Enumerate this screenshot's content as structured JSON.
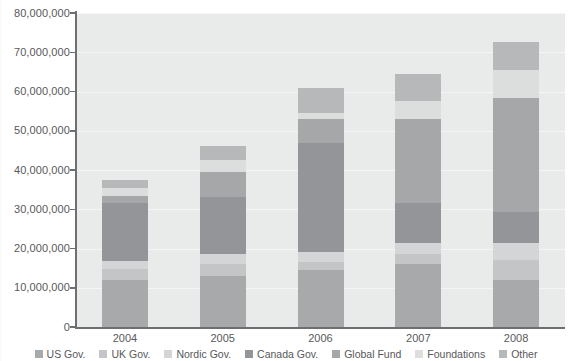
{
  "chart_data": {
    "type": "bar",
    "subtype": "stacked-bar",
    "title": "",
    "xlabel": "",
    "ylabel": "",
    "categories": [
      "2004",
      "2005",
      "2006",
      "2007",
      "2008"
    ],
    "ylim": [
      0,
      80000000
    ],
    "ytick_values": [
      0,
      10000000,
      20000000,
      30000000,
      40000000,
      50000000,
      60000000,
      70000000,
      80000000
    ],
    "ytick_labels": [
      "0",
      "10,000,000",
      "20,000,000",
      "30,000,000",
      "40,000,000",
      "50,000,000",
      "60,000,000",
      "70,000,000",
      "80,000,000"
    ],
    "grid": true,
    "legend_position": "bottom",
    "series": [
      {
        "name": "US Gov.",
        "color": "#a7a9ab",
        "values": [
          12000000,
          13000000,
          14500000,
          16000000,
          12000000
        ]
      },
      {
        "name": "UK Gov.",
        "color": "#c3c5c6",
        "values": [
          2700000,
          3000000,
          2000000,
          2500000,
          5000000
        ]
      },
      {
        "name": "Nordic Gov.",
        "color": "#d4d5d6",
        "values": [
          2000000,
          2700000,
          2500000,
          3000000,
          4500000
        ]
      },
      {
        "name": "Canada Gov.",
        "color": "#939598",
        "values": [
          15000000,
          14300000,
          28000000,
          10000000,
          7800000
        ]
      },
      {
        "name": "Global Fund",
        "color": "#a5a7a9",
        "values": [
          1800000,
          6500000,
          6000000,
          21500000,
          29000000
        ]
      },
      {
        "name": "Foundations",
        "color": "#dcdddd",
        "values": [
          2000000,
          3000000,
          1500000,
          4500000,
          7200000
        ]
      },
      {
        "name": "Other",
        "color": "#b6b8b9",
        "values": [
          2000000,
          3500000,
          6500000,
          7000000,
          7000000
        ]
      }
    ],
    "totals": [
      37500000,
      46000000,
      61000000,
      64500000,
      72500000
    ]
  },
  "legend": {
    "items": [
      {
        "label": "US Gov.",
        "color": "#a7a9ab"
      },
      {
        "label": "UK Gov.",
        "color": "#c3c5c6"
      },
      {
        "label": "Nordic Gov.",
        "color": "#d4d5d6"
      },
      {
        "label": "Canada Gov.",
        "color": "#939598"
      },
      {
        "label": "Global Fund",
        "color": "#a5a7a9"
      },
      {
        "label": "Foundations",
        "color": "#dcdddd"
      },
      {
        "label": "Other",
        "color": "#b6b8b9"
      }
    ]
  },
  "style": {
    "plot_background": "#e9eaea",
    "axis_color": "#6d6e70",
    "gridline_color": "#f4f5f5",
    "text_color": "#58585a",
    "page_background": "#ffffff"
  }
}
